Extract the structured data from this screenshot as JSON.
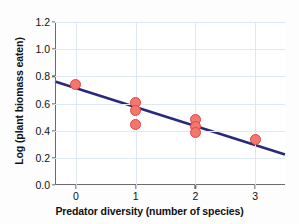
{
  "chart_data": {
    "type": "scatter",
    "title": "",
    "xlabel": "Predator diversity (number of species)",
    "ylabel": "Log (plant biomass eaten)",
    "xlim": [
      -0.35,
      3.5
    ],
    "ylim": [
      0.0,
      1.2
    ],
    "xticks": [
      0,
      1,
      2,
      3
    ],
    "xtick_labels": [
      "0",
      "1",
      "2",
      "3"
    ],
    "yticks": [
      0.0,
      0.2,
      0.4,
      0.6,
      0.8,
      1.0,
      1.2
    ],
    "ytick_labels": [
      "0.0",
      "0.2",
      "0.4",
      "0.6",
      "0.8",
      "1.0",
      "1.2"
    ],
    "grid": true,
    "legend": "none",
    "series": [
      {
        "name": "observations",
        "marker": "circle",
        "marker_color": "#f5766a",
        "marker_edge_color": "#e0464a",
        "points": [
          {
            "x": 0,
            "y": 0.74
          },
          {
            "x": 1,
            "y": 0.61
          },
          {
            "x": 1,
            "y": 0.55
          },
          {
            "x": 1,
            "y": 0.445
          },
          {
            "x": 2,
            "y": 0.48
          },
          {
            "x": 2,
            "y": 0.43
          },
          {
            "x": 2,
            "y": 0.385
          },
          {
            "x": 3,
            "y": 0.335
          }
        ]
      }
    ],
    "trendline": {
      "name": "regression-line",
      "color": "#2a2a7a",
      "width": 2.6,
      "x_start": -0.35,
      "y_start": 0.762,
      "x_end": 3.5,
      "y_end": 0.225
    }
  }
}
